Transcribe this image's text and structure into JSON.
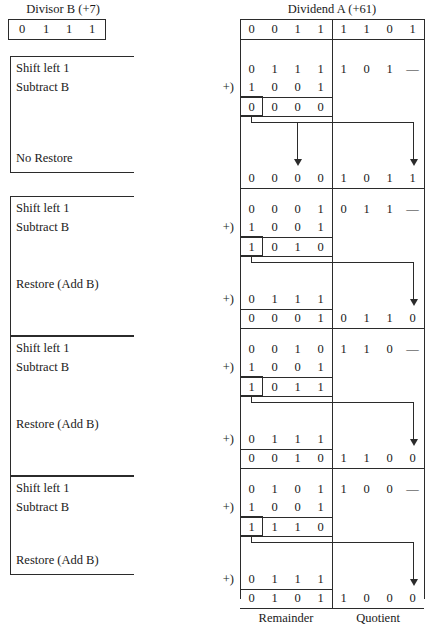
{
  "left_panel": {
    "divisor_label": "Divisor B (+7)",
    "divisor_bits": [
      "0",
      "1",
      "1",
      "1"
    ],
    "steps": [
      {
        "lines": [
          "Shift left 1",
          "Subtract B"
        ],
        "outcome": "No Restore"
      },
      {
        "lines": [
          "Shift left 1",
          "Subtract B"
        ],
        "outcome": "Restore (Add B)"
      },
      {
        "lines": [
          "Shift left 1",
          "Subtract B"
        ],
        "outcome": "Restore (Add B)"
      },
      {
        "lines": [
          "Shift left 1",
          "Subtract B"
        ],
        "outcome": "Restore (Add B)"
      }
    ]
  },
  "right_panel": {
    "dividend_label": "Dividend A (+61)",
    "plus_symbol": "+)",
    "footer": {
      "remainder": "Remainder",
      "quotient": "Quotient"
    },
    "initial_row": {
      "remainder": [
        "0",
        "0",
        "1",
        "1"
      ],
      "quotient": [
        "1",
        "1",
        "0",
        "1"
      ]
    },
    "iterations": [
      {
        "shift": {
          "remainder": [
            "0",
            "1",
            "1",
            "1"
          ],
          "quotient": [
            "1",
            "0",
            "1",
            "—"
          ]
        },
        "subtract": {
          "remainder": [
            "1",
            "0",
            "0",
            "1"
          ]
        },
        "diff": {
          "remainder": [
            "0",
            "0",
            "0",
            "0"
          ]
        },
        "restore": null,
        "result": {
          "remainder": [
            "0",
            "0",
            "0",
            "0"
          ],
          "quotient": [
            "1",
            "0",
            "1",
            "1"
          ]
        }
      },
      {
        "shift": {
          "remainder": [
            "0",
            "0",
            "0",
            "1"
          ],
          "quotient": [
            "0",
            "1",
            "1",
            "—"
          ]
        },
        "subtract": {
          "remainder": [
            "1",
            "0",
            "0",
            "1"
          ]
        },
        "diff": {
          "remainder": [
            "1",
            "0",
            "1",
            "0"
          ]
        },
        "restore": {
          "remainder": [
            "0",
            "1",
            "1",
            "1"
          ]
        },
        "result": {
          "remainder": [
            "0",
            "0",
            "0",
            "1"
          ],
          "quotient": [
            "0",
            "1",
            "1",
            "0"
          ]
        }
      },
      {
        "shift": {
          "remainder": [
            "0",
            "0",
            "1",
            "0"
          ],
          "quotient": [
            "1",
            "1",
            "0",
            "—"
          ]
        },
        "subtract": {
          "remainder": [
            "1",
            "0",
            "0",
            "1"
          ]
        },
        "diff": {
          "remainder": [
            "1",
            "0",
            "1",
            "1"
          ]
        },
        "restore": {
          "remainder": [
            "0",
            "1",
            "1",
            "1"
          ]
        },
        "result": {
          "remainder": [
            "0",
            "0",
            "1",
            "0"
          ],
          "quotient": [
            "1",
            "1",
            "0",
            "0"
          ]
        }
      },
      {
        "shift": {
          "remainder": [
            "0",
            "1",
            "0",
            "1"
          ],
          "quotient": [
            "1",
            "0",
            "0",
            "—"
          ]
        },
        "subtract": {
          "remainder": [
            "1",
            "0",
            "0",
            "1"
          ]
        },
        "diff": {
          "remainder": [
            "1",
            "1",
            "1",
            "0"
          ]
        },
        "restore": {
          "remainder": [
            "0",
            "1",
            "1",
            "1"
          ]
        },
        "result": {
          "remainder": [
            "0",
            "1",
            "0",
            "1"
          ],
          "quotient": [
            "1",
            "0",
            "0",
            "0"
          ]
        }
      }
    ]
  },
  "colors": {
    "ink": "#2b2b2b",
    "paper": "#ffffff"
  }
}
